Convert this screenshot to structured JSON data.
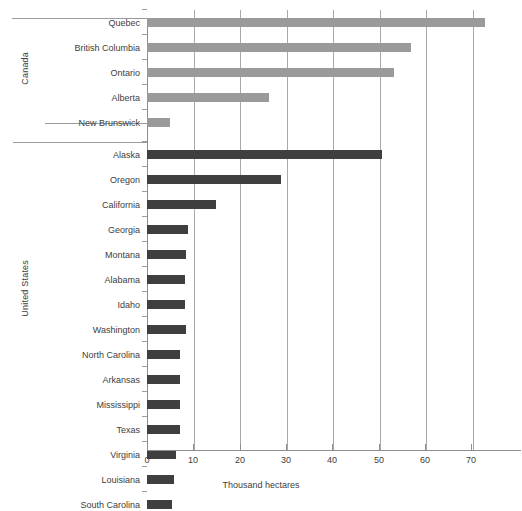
{
  "chart_data": {
    "type": "bar",
    "orientation": "horizontal",
    "title": "",
    "subtitle": "",
    "xlabel": "Thousand hectares",
    "ylabel": "",
    "xlim": [
      0,
      75
    ],
    "grid": true,
    "legend": "none",
    "xticks": [
      0,
      10,
      20,
      30,
      40,
      50,
      60,
      70
    ],
    "xticklabels": [
      "0",
      "10",
      "20",
      "30",
      "40",
      "50",
      "60",
      "70"
    ],
    "groups": [
      {
        "name": "Canada",
        "color": "#9a9a9a",
        "categories": [
          "Quebec",
          "British Columbia",
          "Ontario",
          "Alberta",
          "New Brunswick"
        ],
        "values": [
          72.5,
          56.7,
          53.0,
          26.3,
          5.0
        ]
      },
      {
        "name": "United States",
        "color": "#3f3f3f",
        "categories": [
          "Alaska",
          "Oregon",
          "California",
          "Georgia",
          "Montana",
          "Alabama",
          "Idaho",
          "Washington",
          "North Carolina",
          "Arkansas",
          "Mississippi",
          "Texas",
          "Virginia",
          "Louisiana",
          "South Carolina"
        ],
        "values": [
          50.5,
          28.7,
          14.8,
          8.8,
          8.4,
          8.2,
          8.1,
          8.3,
          7.1,
          7.1,
          7.1,
          7.0,
          6.2,
          5.8,
          5.4
        ]
      }
    ]
  },
  "axis": {
    "x_title": "Thousand hectares",
    "group_labels": [
      "Canada",
      "United States"
    ]
  }
}
